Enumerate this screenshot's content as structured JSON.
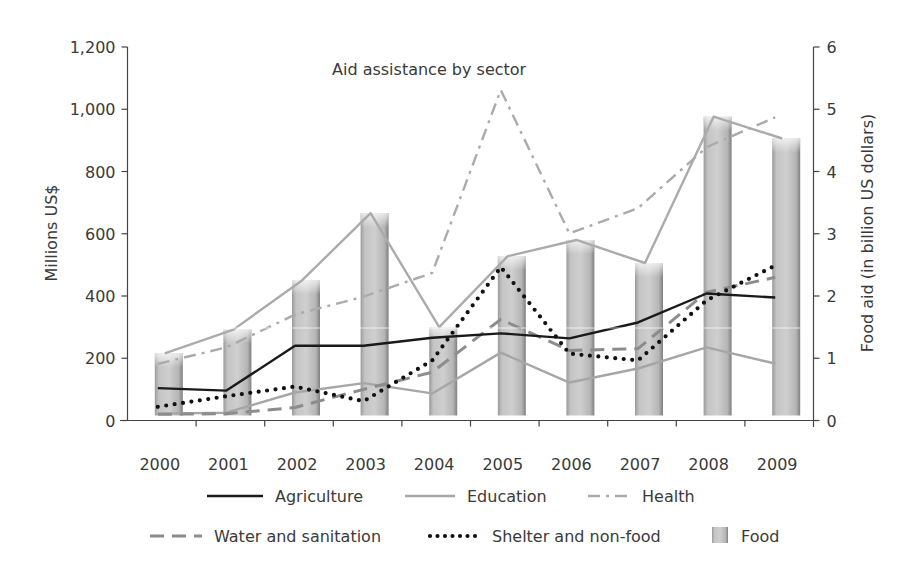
{
  "chart_data": {
    "type": "bar+line",
    "title": "Aid assistance by sector",
    "xlabel": "",
    "ylabel": "Millions US$",
    "y2label": "Food aid (in billion US dollars)",
    "ylim": [
      0,
      1200
    ],
    "y2lim": [
      0,
      6
    ],
    "yticks": [
      "0",
      "200",
      "400",
      "600",
      "800",
      "1,000",
      "1,200"
    ],
    "y2ticks": [
      "0",
      "1",
      "2",
      "3",
      "4",
      "5",
      "6"
    ],
    "categories": [
      "2000",
      "2001",
      "2002",
      "2003",
      "2004",
      "2005",
      "2006",
      "2007",
      "2008",
      "2009"
    ],
    "grid": false,
    "legend_position": "bottom",
    "series": [
      {
        "name": "Agriculture",
        "type": "line",
        "axis": "left",
        "style": "solid",
        "color": "#1a1a1a",
        "values": [
          104,
          96,
          240,
          240,
          266,
          280,
          264,
          315,
          408,
          395
        ]
      },
      {
        "name": "Education",
        "type": "line",
        "axis": "left",
        "style": "solid",
        "color": "#a6a6a6",
        "values": [
          22,
          25,
          90,
          120,
          87,
          218,
          122,
          167,
          235,
          183
        ]
      },
      {
        "name": "Health",
        "type": "line",
        "axis": "left",
        "style": "dashdot",
        "color": "#ababab",
        "values": [
          182,
          235,
          340,
          398,
          474,
          1062,
          601,
          682,
          878,
          974
        ]
      },
      {
        "name": "Water and sanitation",
        "type": "line",
        "axis": "left",
        "style": "dashed",
        "color": "#8c8c8c",
        "values": [
          20,
          22,
          42,
          100,
          155,
          325,
          225,
          231,
          412,
          460
        ]
      },
      {
        "name": "Shelter and non-food",
        "type": "line",
        "axis": "left",
        "style": "dotted",
        "color": "#111111",
        "values": [
          44,
          78,
          109,
          62,
          193,
          493,
          215,
          193,
          386,
          498
        ]
      },
      {
        "name": "Food",
        "type": "bar",
        "axis": "right",
        "color": "#b8b8b8",
        "values": [
          1.08,
          1.46,
          2.25,
          3.33,
          1.5,
          2.64,
          2.9,
          2.53,
          4.88,
          4.53
        ]
      }
    ]
  },
  "legend": {
    "rows": [
      [
        "Agriculture",
        "Education",
        "Health"
      ],
      [
        "Water and sanitation",
        "Shelter and non-food",
        "Food"
      ]
    ]
  }
}
